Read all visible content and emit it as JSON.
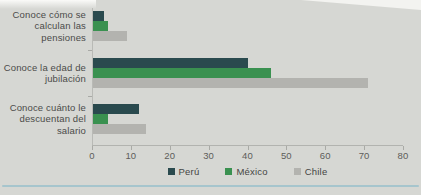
{
  "chart_data": {
    "type": "bar",
    "orientation": "horizontal",
    "title": "",
    "categories": [
      "Conoce cómo se calculan las pensiones",
      "Conoce la edad de jubilación",
      "Conoce cuánto le descuentan del salario"
    ],
    "series": [
      {
        "name": "Perú",
        "color": "#2a4a4e",
        "values": [
          3,
          40,
          12
        ]
      },
      {
        "name": "México",
        "color": "#3a9150",
        "values": [
          4,
          46,
          4
        ]
      },
      {
        "name": "Chile",
        "color": "#b3b3af",
        "values": [
          9,
          71,
          14
        ]
      }
    ],
    "xlim": [
      0,
      80
    ],
    "x_ticks": [
      "0",
      "10",
      "20",
      "30",
      "40",
      "50",
      "60",
      "70",
      "80"
    ],
    "xlabel": "",
    "ylabel": "",
    "grid": false,
    "legend_position": "bottom"
  },
  "colors": {
    "background": "#d6d7d3",
    "axis": "#b2b3af",
    "category_text": "#4b4b49",
    "tick_text": "#5d5d5a",
    "legend_text": "#454543",
    "bottom_rule": "#a6c5cd"
  }
}
